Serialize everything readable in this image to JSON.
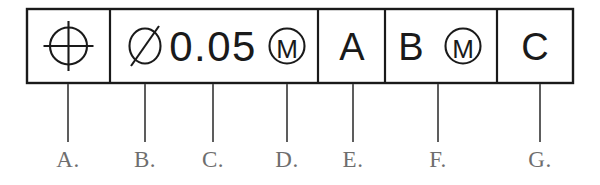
{
  "diagram": {
    "type": "gdt-feature-control-frame",
    "stroke_color": "#1a1a1a",
    "label_color": "#6e6e6e",
    "background_color": "#ffffff",
    "frame": {
      "x": 27,
      "y": 9,
      "width": 546,
      "height": 74
    },
    "compartments": [
      {
        "id": "geometric-characteristic",
        "x": 27,
        "width": 83,
        "content_kind": "symbol",
        "symbol": "position-symbol",
        "text": ""
      },
      {
        "id": "tolerance",
        "x": 110,
        "width": 208,
        "content_kind": "text-and-symbols",
        "diameter_symbol": "diameter-symbol",
        "text": "0.05",
        "modifier": "M",
        "modifier_symbol": "mmc-modifier-symbol"
      },
      {
        "id": "primary-datum",
        "x": 318,
        "width": 67,
        "content_kind": "text",
        "text": "A"
      },
      {
        "id": "secondary-datum",
        "x": 385,
        "width": 112,
        "content_kind": "text-and-symbols",
        "text": "B",
        "modifier": "M",
        "modifier_symbol": "mmc-modifier-symbol"
      },
      {
        "id": "tertiary-datum",
        "x": 497,
        "width": 76,
        "content_kind": "text",
        "text": "C"
      }
    ],
    "leaders": [
      {
        "key": "A",
        "label": "A.",
        "x": 68,
        "y_top": 84,
        "y_bottom": 142,
        "label_y": 148,
        "points_to": "geometric-characteristic-symbol"
      },
      {
        "key": "B",
        "label": "B.",
        "x": 145,
        "y_top": 84,
        "y_bottom": 142,
        "label_y": 148,
        "points_to": "diameter-symbol"
      },
      {
        "key": "C",
        "label": "C.",
        "x": 213,
        "y_top": 84,
        "y_bottom": 142,
        "label_y": 148,
        "points_to": "tolerance-value"
      },
      {
        "key": "D",
        "label": "D.",
        "x": 287,
        "y_top": 84,
        "y_bottom": 142,
        "label_y": 148,
        "points_to": "tolerance-modifier"
      },
      {
        "key": "E",
        "label": "E.",
        "x": 353,
        "y_top": 84,
        "y_bottom": 142,
        "label_y": 148,
        "points_to": "primary-datum"
      },
      {
        "key": "F",
        "label": "F.",
        "x": 438,
        "y_top": 84,
        "y_bottom": 142,
        "label_y": 148,
        "points_to": "secondary-datum"
      },
      {
        "key": "G",
        "label": "G.",
        "x": 540,
        "y_top": 84,
        "y_bottom": 142,
        "label_y": 148,
        "points_to": "tertiary-datum"
      }
    ]
  }
}
